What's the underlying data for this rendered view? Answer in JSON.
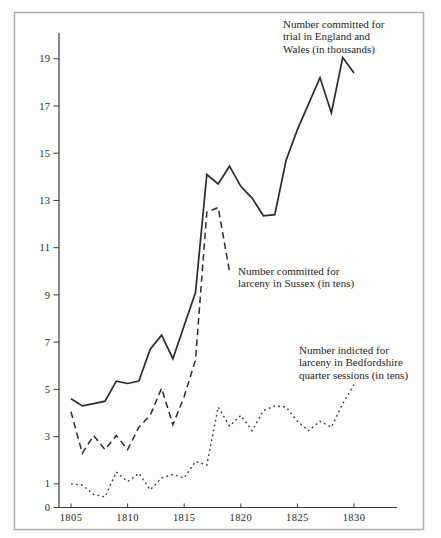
{
  "figure": {
    "background": "#fdfdfc",
    "frame_color": "#b0b0b0",
    "ink_color": "#2b2b2b",
    "annotations": {
      "england_wales": [
        "Number committed for",
        "trial in England and",
        "Wales (in thousands)"
      ],
      "sussex": [
        "Number committed for",
        "larceny in Sussex (in tens)"
      ],
      "bedfordshire": [
        "Number indicted for",
        "larceny in Bedfordshire",
        "quarter sessions (in tens)"
      ]
    }
  },
  "chart_data": {
    "type": "line",
    "title": "",
    "xlabel": "",
    "ylabel": "",
    "xlim": [
      1805,
      1830
    ],
    "ylim": [
      0,
      20
    ],
    "xticks": [
      1805,
      1810,
      1815,
      1820,
      1825,
      1830
    ],
    "yticks": [
      0,
      1,
      3,
      5,
      7,
      9,
      11,
      13,
      15,
      17,
      19
    ],
    "grid": false,
    "legend_position": "inline-annotations",
    "series": [
      {
        "name": "Number committed for trial in England and Wales (in thousands)",
        "style": "solid",
        "years": [
          1805,
          1806,
          1807,
          1808,
          1809,
          1810,
          1811,
          1812,
          1813,
          1814,
          1815,
          1816,
          1817,
          1818,
          1819,
          1820,
          1821,
          1822,
          1823,
          1824,
          1825,
          1826,
          1827,
          1828,
          1829,
          1830
        ],
        "values": [
          4.6,
          4.3,
          4.4,
          4.5,
          5.35,
          5.25,
          5.35,
          6.7,
          7.3,
          6.3,
          7.7,
          9.1,
          14.1,
          13.7,
          14.45,
          13.6,
          13.1,
          12.35,
          12.4,
          14.7,
          16.0,
          17.1,
          18.2,
          16.7,
          19.05,
          18.4
        ]
      },
      {
        "name": "Number committed for larceny in Sussex (in tens)",
        "style": "dashed",
        "years": [
          1805,
          1806,
          1807,
          1808,
          1809,
          1810,
          1811,
          1812,
          1813,
          1814,
          1815,
          1816,
          1817,
          1818,
          1819
        ],
        "values": [
          4.05,
          2.3,
          3.05,
          2.45,
          3.05,
          2.45,
          3.4,
          3.9,
          5.05,
          3.5,
          4.7,
          6.25,
          12.5,
          12.7,
          10.0
        ]
      },
      {
        "name": "Number indicted for larceny in Bedfordshire quarter sessions (in tens)",
        "style": "dotted",
        "years": [
          1805,
          1806,
          1807,
          1808,
          1809,
          1810,
          1811,
          1812,
          1813,
          1814,
          1815,
          1816,
          1817,
          1818,
          1819,
          1820,
          1821,
          1822,
          1823,
          1824,
          1825,
          1826,
          1827,
          1828,
          1829,
          1830
        ],
        "values": [
          1.0,
          0.95,
          0.55,
          0.45,
          1.5,
          1.1,
          1.45,
          0.75,
          1.25,
          1.4,
          1.25,
          1.95,
          1.8,
          4.25,
          3.45,
          3.9,
          3.25,
          4.1,
          4.3,
          4.25,
          3.65,
          3.25,
          3.65,
          3.4,
          4.4,
          5.2
        ]
      }
    ]
  }
}
